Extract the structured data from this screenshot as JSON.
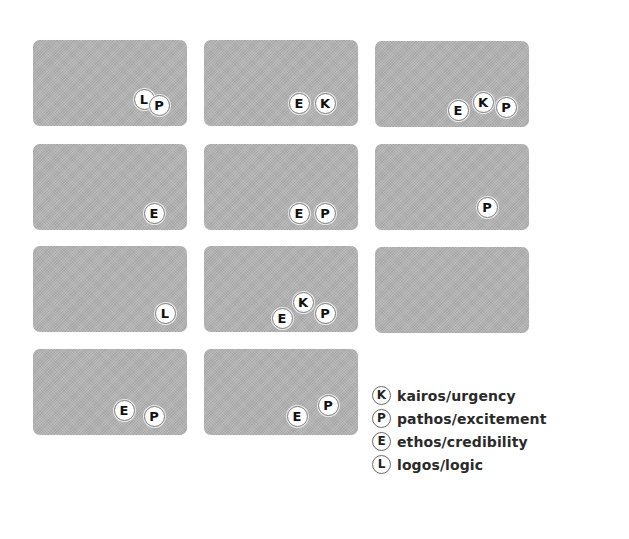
{
  "colors": {
    "card_fill": "#b3b3b3",
    "badge_fill": "#ffffff",
    "badge_border": "#7a7a7a",
    "letter": "#111111",
    "legend_text": "#2a2a2a"
  },
  "cards": [
    {
      "id": 1,
      "left": 33,
      "top": 40,
      "badges": [
        {
          "letter": "L",
          "x": 144,
          "y": 99
        },
        {
          "letter": "P",
          "x": 159,
          "y": 105
        }
      ]
    },
    {
      "id": 2,
      "left": 204,
      "top": 40,
      "badges": [
        {
          "letter": "E",
          "x": 299,
          "y": 103
        },
        {
          "letter": "K",
          "x": 325,
          "y": 103
        }
      ]
    },
    {
      "id": 3,
      "left": 375,
      "top": 41,
      "badges": [
        {
          "letter": "E",
          "x": 458,
          "y": 110
        },
        {
          "letter": "K",
          "x": 483,
          "y": 102
        },
        {
          "letter": "P",
          "x": 506,
          "y": 107
        }
      ]
    },
    {
      "id": 4,
      "left": 33,
      "top": 144,
      "badges": [
        {
          "letter": "E",
          "x": 154,
          "y": 213
        }
      ]
    },
    {
      "id": 5,
      "left": 204,
      "top": 144,
      "badges": [
        {
          "letter": "E",
          "x": 299,
          "y": 213
        },
        {
          "letter": "P",
          "x": 325,
          "y": 213
        }
      ]
    },
    {
      "id": 6,
      "left": 375,
      "top": 144,
      "badges": [
        {
          "letter": "P",
          "x": 487,
          "y": 207
        }
      ]
    },
    {
      "id": 7,
      "left": 33,
      "top": 246,
      "badges": [
        {
          "letter": "L",
          "x": 165,
          "y": 313
        }
      ]
    },
    {
      "id": 8,
      "left": 204,
      "top": 246,
      "badges": [
        {
          "letter": "E",
          "x": 282,
          "y": 318
        },
        {
          "letter": "K",
          "x": 303,
          "y": 302
        },
        {
          "letter": "P",
          "x": 325,
          "y": 313
        }
      ]
    },
    {
      "id": 9,
      "left": 375,
      "top": 247,
      "badges": []
    },
    {
      "id": 10,
      "left": 33,
      "top": 349,
      "badges": [
        {
          "letter": "E",
          "x": 124,
          "y": 410
        },
        {
          "letter": "P",
          "x": 154,
          "y": 416
        }
      ]
    },
    {
      "id": 11,
      "left": 204,
      "top": 349,
      "badges": [
        {
          "letter": "E",
          "x": 297,
          "y": 416
        },
        {
          "letter": "P",
          "x": 328,
          "y": 405
        }
      ]
    }
  ],
  "legend": [
    {
      "letter": "K",
      "label": "kairos/urgency"
    },
    {
      "letter": "P",
      "label": "pathos/excitement"
    },
    {
      "letter": "E",
      "label": "ethos/credibility"
    },
    {
      "letter": "L",
      "label": "logos/logic"
    }
  ]
}
